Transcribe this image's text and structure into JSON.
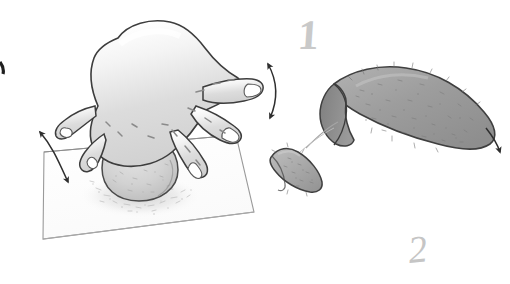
{
  "illustration": {
    "title": "Dough shaping steps illustration",
    "style": "pencil-sketch",
    "canvas": {
      "width": 510,
      "height": 284,
      "background": "#ffffff"
    },
    "palette": {
      "outline": "#3a3a3a",
      "hand_fill": "#d8d8d8",
      "hand_highlight": "#ffffff",
      "board_fill": "#fdfdfd",
      "board_outline": "#8f8f8f",
      "dough_ball_fill": "#cfcfcf",
      "loaf_fill": "#9e9e9e",
      "loaf_cap_fill": "#8a8a8a",
      "wedge_fill": "#a8a8a8",
      "numeral_gray": "#c9c9c9",
      "arrow_color": "#2e2e2e",
      "flour_speck": "#bdbdbd"
    },
    "step_labels": [
      {
        "name": "step-one",
        "text": "1",
        "x": 298,
        "y": 14
      },
      {
        "name": "step-two",
        "text": "2",
        "x": 408,
        "y": 230
      }
    ],
    "objects": [
      {
        "name": "work-board",
        "description": "square floured board in perspective"
      },
      {
        "name": "dough-ball",
        "description": "round speckled dough ball on board"
      },
      {
        "name": "flour-dust",
        "description": "scattered flour specks and shadow under dough ball"
      },
      {
        "name": "hand",
        "description": "open hand with five spread fingers pressing dough"
      },
      {
        "name": "large-loaf",
        "description": "large pointed teardrop loaf with darker cut end at left"
      },
      {
        "name": "small-wedge",
        "description": "small teardrop dough wedge"
      },
      {
        "name": "connector-line",
        "description": "thin guide line from wedge to loaf cut face"
      }
    ],
    "arrows": [
      {
        "name": "arrow-double-left",
        "kind": "double-headed curved",
        "direction": "up-left / down-right"
      },
      {
        "name": "arrow-double-right",
        "kind": "double-headed curved",
        "direction": "up / down"
      },
      {
        "name": "arrow-single-right",
        "kind": "single-headed curved",
        "direction": "down-right"
      },
      {
        "name": "arrow-edge-mark",
        "kind": "partial mark at left edge",
        "direction": "n/a"
      }
    ]
  }
}
